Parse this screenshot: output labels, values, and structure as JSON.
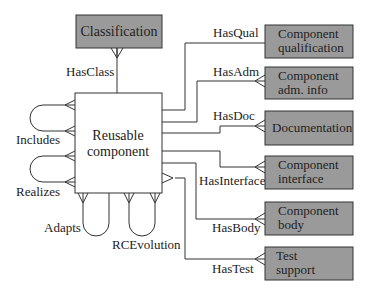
{
  "diagram": {
    "main_entity": {
      "label_line1": "Reusable",
      "label_line2": "component"
    },
    "top_entity": {
      "label": "Classification",
      "relation": "HasClass"
    },
    "self_relations": {
      "includes": "Includes",
      "realizes": "Realizes",
      "adapts": "Adapts",
      "rcevolution": "RCEvolution"
    },
    "right_entities": [
      {
        "line1": "Component",
        "line2": "qualification",
        "relation": "HasQual"
      },
      {
        "line1": "Component",
        "line2": "adm. info",
        "relation": "HasAdm"
      },
      {
        "line1": "Documentation",
        "line2": "",
        "relation": "HasDoc"
      },
      {
        "line1": "Component",
        "line2": "interface",
        "relation": "HasInterface"
      },
      {
        "line1": "Component",
        "line2": "body",
        "relation": "HasBody"
      },
      {
        "line1": "Test",
        "line2": "support",
        "relation": "HasTest"
      }
    ],
    "colors": {
      "entity_fill": "#9a9a9a",
      "line": "#333333"
    }
  }
}
